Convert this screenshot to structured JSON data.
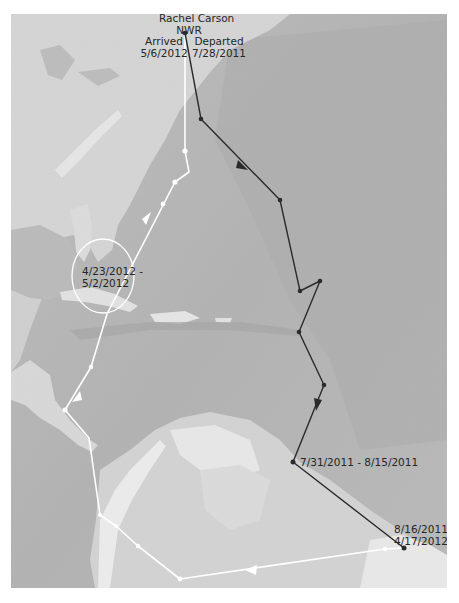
{
  "map": {
    "type": "voyage-track-map",
    "background_style": "grayscale shaded relief",
    "colors": {
      "ocean": "#b6b6b6",
      "ocean_deep": "#adadad",
      "land": "#d6d6d6",
      "land_high": "#ebebeb",
      "outbound_track": "#2b2b2b",
      "return_track": "#ffffff",
      "label_text": "#262626",
      "page_background": "#ffffff"
    },
    "origin": {
      "name_line1": "Rachel Carson",
      "name_line2": "NWR"
    },
    "labels": {
      "arrived_line1": "Arrived",
      "arrived_line2": "5/6/2012",
      "departed_line1": "Departed",
      "departed_line2": "7/28/2011",
      "stopover_caribbean_line1": "4/23/2012 -",
      "stopover_caribbean_line2": "5/2/2012",
      "stopover_1": "7/31/2011 - 8/15/2011",
      "wintering_line1": "8/16/2011 -",
      "wintering_line2": "4/17/2012"
    },
    "tracks": {
      "outbound": {
        "description": "Departure route (dark line)",
        "points": [
          [
            185,
            33
          ],
          [
            201,
            119
          ],
          [
            280,
            200
          ],
          [
            300,
            291
          ],
          [
            320,
            281
          ],
          [
            299,
            332
          ],
          [
            324,
            385
          ],
          [
            293,
            462
          ],
          [
            404,
            548
          ]
        ]
      },
      "return": {
        "description": "Return route (white line)",
        "points": [
          [
            404,
            548
          ],
          [
            385,
            549
          ],
          [
            180,
            579
          ],
          [
            138,
            546
          ],
          [
            116,
            526
          ],
          [
            100,
            515
          ],
          [
            89,
            438
          ],
          [
            65,
            410
          ],
          [
            91,
            367
          ],
          [
            107,
            314
          ],
          [
            175,
            182
          ],
          [
            189,
            172
          ],
          [
            185,
            151
          ],
          [
            185,
            33
          ]
        ]
      }
    },
    "highlight_circle": {
      "center": [
        103,
        276
      ],
      "rx": 31,
      "ry": 37
    }
  }
}
